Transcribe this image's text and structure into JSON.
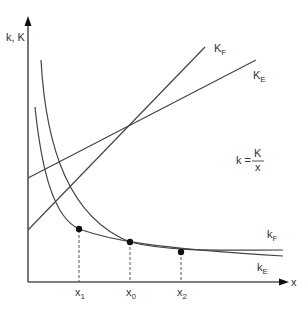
{
  "diagram": {
    "axes": {
      "y_label": "k, K",
      "x_label": "x"
    },
    "lines": {
      "KF": {
        "label_main": "K",
        "label_sub": "F"
      },
      "KE": {
        "label_main": "K",
        "label_sub": "E"
      }
    },
    "curves": {
      "kF": {
        "label_main": "k",
        "label_sub": "F"
      },
      "kE": {
        "label_main": "k",
        "label_sub": "E"
      }
    },
    "formula": {
      "lhs": "k =",
      "numerator": "K",
      "denominator": "x"
    },
    "points": [
      {
        "label_main": "x",
        "label_sub": "1"
      },
      {
        "label_main": "x",
        "label_sub": "0"
      },
      {
        "label_main": "x",
        "label_sub": "2"
      }
    ],
    "colors": {
      "line": "#444444",
      "axis": "#555555",
      "text": "#333333"
    }
  }
}
